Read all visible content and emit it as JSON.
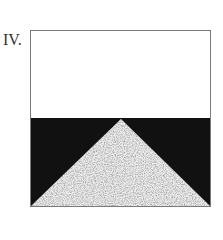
{
  "figure": {
    "label": "IV.",
    "colors": {
      "border": "#7a7a7a",
      "top_fill": "#ffffff",
      "bottom_fill": "#111111",
      "triangle_fill": "#c8c8c8",
      "speckle": "#555555"
    }
  }
}
